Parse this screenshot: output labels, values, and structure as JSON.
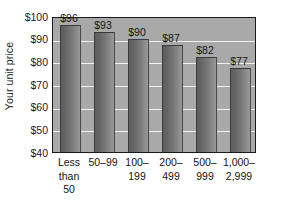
{
  "chart_data": {
    "type": "bar",
    "title": "",
    "xlabel": "",
    "ylabel": "Your unit price",
    "ylim": [
      40,
      100
    ],
    "ytick_step": 10,
    "grid": true,
    "legend": false,
    "categories": [
      "Less than 50",
      "50–99",
      "100–199",
      "200–499",
      "500–999",
      "1,000–2,999"
    ],
    "category_lines": [
      [
        "Less",
        "than",
        "50"
      ],
      [
        "50–99"
      ],
      [
        "100–",
        "199"
      ],
      [
        "200–",
        "499"
      ],
      [
        "500–",
        "999"
      ],
      [
        "1,000–",
        "2,999"
      ]
    ],
    "values": [
      96,
      93,
      90,
      87,
      82,
      77
    ],
    "value_labels": [
      "$96",
      "$93",
      "$90",
      "$87",
      "$82",
      "$77"
    ],
    "ytick_labels": [
      "$100",
      "$90",
      "$80",
      "$70",
      "$60",
      "$50",
      "$40"
    ],
    "yticks": [
      100,
      90,
      80,
      70,
      60,
      50,
      40
    ],
    "colors": {
      "plot_background": "#a9a9a9",
      "gridline": "#f2f2f2",
      "bar_dark": "#5d5d5d",
      "bar_light": "#989898",
      "axis": "#1a1a1a",
      "text": "#141414",
      "page_background": "#ffffff"
    }
  }
}
